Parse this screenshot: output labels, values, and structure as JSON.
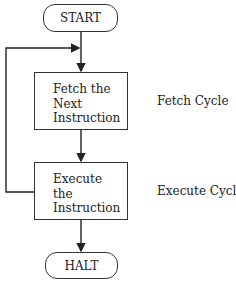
{
  "diagram": {
    "type": "flowchart",
    "nodes": {
      "start": {
        "label": "START",
        "shape": "terminator"
      },
      "fetch": {
        "lines": [
          "Fetch the",
          "Next",
          "Instruction"
        ],
        "shape": "process"
      },
      "execute": {
        "lines": [
          "Execute",
          "the",
          "Instruction"
        ],
        "shape": "process"
      },
      "halt": {
        "label": "HALT",
        "shape": "terminator"
      }
    },
    "annotations": {
      "fetch_cycle": "Fetch Cycle",
      "execute_cycle": "Execute Cycle"
    },
    "edges": [
      {
        "from": "start",
        "to": "fetch"
      },
      {
        "from": "fetch",
        "to": "execute"
      },
      {
        "from": "execute",
        "to": "fetch",
        "note": "loop back"
      },
      {
        "from": "execute",
        "to": "halt"
      }
    ]
  }
}
